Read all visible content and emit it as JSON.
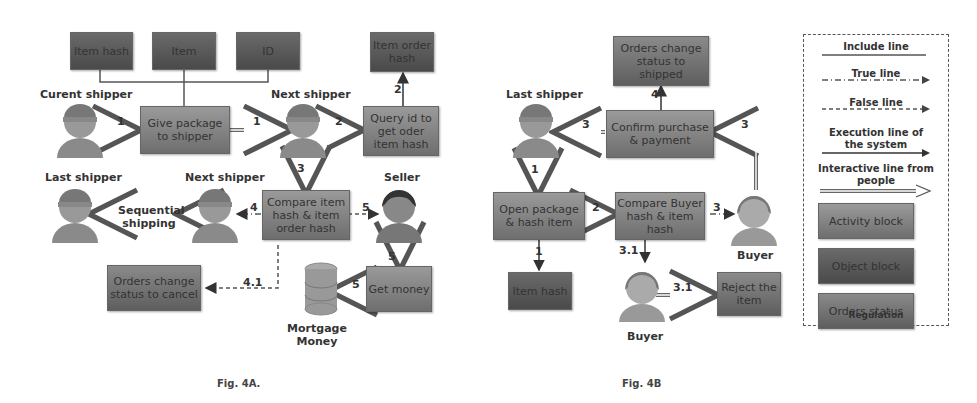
{
  "fig4a": {
    "caption": "Fig. 4A.",
    "objects": {
      "item_hash": "Item hash",
      "item": "Item",
      "id": "ID",
      "item_order_hash": "Item order hash"
    },
    "activities": {
      "give_package": "Give package to shipper",
      "query_id": "Query id to get oder item hash",
      "compare": "Compare item hash & item order hash",
      "get_money": "Get money"
    },
    "status": {
      "cancel": "Orders change status to cancel"
    },
    "actors": {
      "current_shipper": "Curent shipper",
      "next_shipper_1": "Next shipper",
      "next_shipper_2": "Next shipper",
      "last_shipper": "Last shipper",
      "seller": "Seller",
      "mortgage": "Mortgage Money"
    },
    "notes": {
      "sequential": "Sequential shipping"
    },
    "edge_labels": {
      "e1a": "1",
      "e1b": "1",
      "e2a": "2",
      "e2b": "2",
      "e3": "3",
      "e4": "4",
      "e41": "4.1",
      "e5a": "5",
      "e5b": "5",
      "e5c": "5"
    }
  },
  "fig4b": {
    "caption": "Fig. 4B",
    "status": {
      "shipped": "Orders change status to shipped"
    },
    "activities": {
      "confirm": "Confirm purchase & payment",
      "open_package": "Open package & hash item",
      "compare": "Compare Buyer hash & item hash",
      "reject": "Reject the item"
    },
    "objects": {
      "item_hash": "Item hash"
    },
    "actors": {
      "last_shipper": "Last shipper",
      "buyer_1": "Buyer",
      "buyer_2": "Buyer"
    },
    "edge_labels": {
      "e4": "4",
      "e3a": "3",
      "e3b": "3",
      "e1a": "1",
      "e1b": "1",
      "e2": "2",
      "e3c": "3",
      "e31a": "3.1",
      "e31b": "3.1"
    }
  },
  "legend": {
    "include_line": "Include line",
    "true_line": "True line",
    "false_line": "False line",
    "execution_line": "Execution line of the system",
    "interactive_line": "Interactive line from people",
    "activity_block": "Activity block",
    "object_block": "Object block",
    "orders_status": "Orders status",
    "title": "Regulation"
  }
}
